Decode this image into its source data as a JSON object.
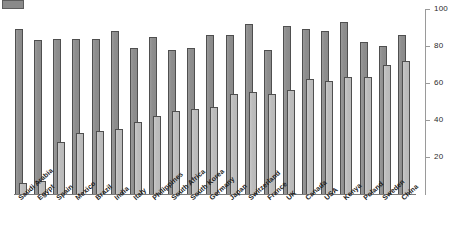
{
  "legend": {
    "swatch_name": "series-swatch",
    "series_labels": []
  },
  "axis": {
    "y_ticks": [
      20,
      40,
      60,
      80,
      100
    ],
    "y_min": 0,
    "y_max": 100,
    "y_position": "right"
  },
  "chart_data": {
    "type": "bar",
    "title": "",
    "xlabel": "",
    "ylabel": "",
    "ylim": [
      0,
      100
    ],
    "grid": false,
    "legend_position": "top-left",
    "categories": [
      "Saudi Arabia",
      "Egypt",
      "Spain",
      "Mexico",
      "Brazil",
      "India",
      "Italy",
      "Philippines",
      "South Africa",
      "South Korea",
      "Germany",
      "Japan",
      "Switzerland",
      "France",
      "UK",
      "Canada",
      "USA",
      "Kenya",
      "Poland",
      "Sweden",
      "China"
    ],
    "series": [
      {
        "name": "series-dark",
        "color": "#8e8e8e",
        "values": [
          89,
          83,
          84,
          84,
          84,
          88,
          79,
          85,
          78,
          79,
          86,
          86,
          92,
          78,
          91,
          89,
          88,
          93,
          82,
          80,
          86
        ]
      },
      {
        "name": "series-light",
        "color": "#bdbdbd",
        "values": [
          6,
          7,
          28,
          33,
          34,
          35,
          39,
          42,
          45,
          46,
          47,
          54,
          55,
          54,
          56,
          62,
          61,
          63,
          63,
          70,
          72
        ]
      }
    ]
  }
}
